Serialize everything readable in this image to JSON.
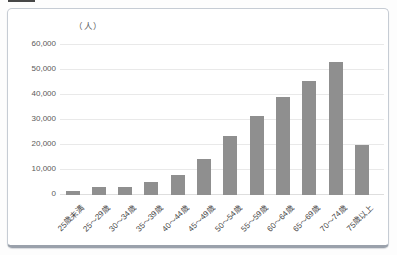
{
  "page": {
    "background_color": "#fdfdfd",
    "card_border_color": "#c6ccd4",
    "card_border_bottom_color": "#9aa1ab"
  },
  "chart_data": {
    "type": "bar",
    "title": "",
    "unit_label": "（人）",
    "categories": [
      "25歳未満",
      "25〜29歳",
      "30〜34歳",
      "35〜39歳",
      "40〜44歳",
      "45〜49歳",
      "50〜54歳",
      "55〜59歳",
      "60〜64歳",
      "65〜69歳",
      "70〜74歳",
      "75歳以上"
    ],
    "values": [
      1000,
      2500,
      2700,
      4500,
      7500,
      14000,
      23000,
      31000,
      38500,
      45000,
      52500,
      19500
    ],
    "xlabel": "",
    "ylabel": "（人）",
    "ylim": [
      0,
      65000
    ],
    "y_ticks": [
      0,
      10000,
      20000,
      30000,
      40000,
      50000,
      60000
    ],
    "y_tick_labels": [
      "0",
      "10,000",
      "20,000",
      "30,000",
      "40,000",
      "50,000",
      "60,000"
    ],
    "grid": "horizontal-on",
    "legend_position": "none",
    "bar_color": "#8f8f8f",
    "gridline_color": "#e9e9e9",
    "zero_line_color": "#dedede",
    "axis_text_color": "#595959"
  }
}
